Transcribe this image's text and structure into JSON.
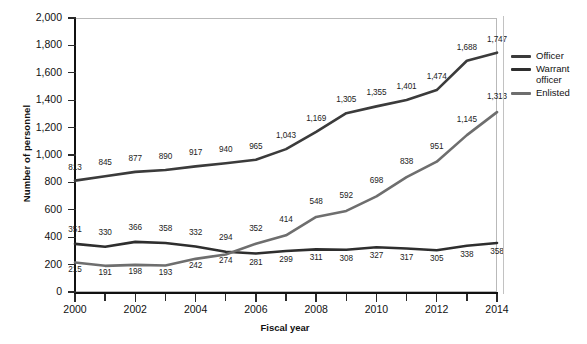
{
  "chart_data": {
    "type": "line",
    "title": "",
    "xlabel": "Fiscal year",
    "ylabel": "Number of personnel",
    "x": [
      2000,
      2001,
      2002,
      2003,
      2004,
      2005,
      2006,
      2007,
      2008,
      2009,
      2010,
      2011,
      2012,
      2013,
      2014
    ],
    "categories": [
      "2000",
      "2001",
      "2002",
      "2003",
      "2004",
      "2005",
      "2006",
      "2007",
      "2008",
      "2009",
      "2010",
      "2011",
      "2012",
      "2013",
      "2014"
    ],
    "xtick_labels": [
      "2000",
      "2002",
      "2004",
      "2006",
      "2008",
      "2010",
      "2012",
      "2014"
    ],
    "ytick_labels": [
      "0",
      "200",
      "400",
      "600",
      "800",
      "1,000",
      "1,200",
      "1,400",
      "1,600",
      "1,800",
      "2,000"
    ],
    "ylim": [
      0,
      2000
    ],
    "xlim": [
      2000,
      2014
    ],
    "ystep": 200,
    "grid": false,
    "legend_position": "right",
    "series": [
      {
        "name": "Officer",
        "color": "#3b3b3b",
        "values": [
          813,
          845,
          877,
          890,
          917,
          940,
          965,
          1043,
          1169,
          1305,
          1355,
          1401,
          1474,
          1688,
          1747
        ],
        "labels": [
          "813",
          "845",
          "877",
          "890",
          "917",
          "940",
          "965",
          "1,043",
          "1,169",
          "1,305",
          "1,355",
          "1,401",
          "1,474",
          "1,688",
          "1,747"
        ]
      },
      {
        "name": "Warrant officer",
        "color": "#2e2e2e",
        "values": [
          351,
          330,
          366,
          358,
          332,
          294,
          281,
          299,
          311,
          308,
          327,
          317,
          305,
          338,
          358
        ],
        "labels": [
          "351",
          "330",
          "366",
          "358",
          "332",
          "294",
          "281",
          "299",
          "311",
          "308",
          "327",
          "317",
          "305",
          "338",
          "358"
        ]
      },
      {
        "name": "Enlisted",
        "color": "#6e6e6e",
        "values": [
          215,
          191,
          198,
          193,
          242,
          274,
          352,
          414,
          548,
          592,
          698,
          838,
          951,
          1145,
          1313
        ],
        "labels": [
          "215",
          "191",
          "198",
          "193",
          "242",
          "274",
          "352",
          "414",
          "548",
          "592",
          "698",
          "838",
          "951",
          "1,145",
          "1,313"
        ]
      }
    ]
  },
  "legend": {
    "items": [
      {
        "label": "Officer",
        "color": "#3b3b3b"
      },
      {
        "label": "Warrant officer",
        "color": "#2e2e2e"
      },
      {
        "label": "Enlisted",
        "color": "#6e6e6e"
      }
    ]
  },
  "axes": {
    "y_title": "Number of personnel",
    "x_title": "Fiscal year"
  }
}
